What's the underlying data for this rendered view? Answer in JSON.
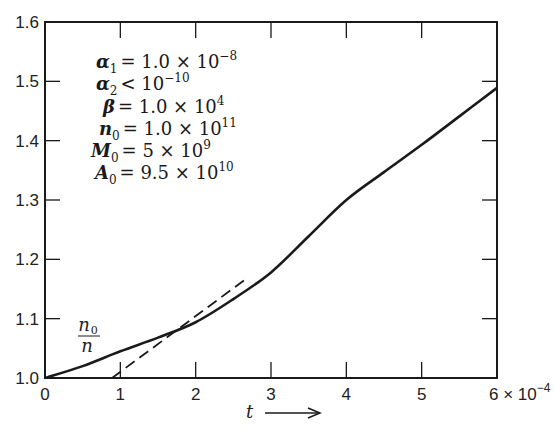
{
  "chart_data": {
    "type": "line",
    "title": "",
    "xlabel": "t",
    "xlabel_arrow": "→",
    "x_multiplier_label": "6 × 10⁻⁴",
    "x_scale_exponent": "-4",
    "ylabel": "",
    "xlim": [
      0,
      6
    ],
    "ylim": [
      1.0,
      1.6
    ],
    "grid": false,
    "x_ticks": [
      "0",
      "1",
      "2",
      "3",
      "4",
      "5",
      "6"
    ],
    "y_ticks": [
      "1.0",
      "1.1",
      "1.2",
      "1.3",
      "1.4",
      "1.5",
      "1.6"
    ],
    "series": [
      {
        "name": "n0/n",
        "style": "solid",
        "label_text": "n₀/n",
        "x": [
          0,
          0.5,
          1,
          1.5,
          2,
          2.5,
          3,
          3.5,
          4,
          4.5,
          5,
          5.5,
          6
        ],
        "values": [
          1.0,
          1.02,
          1.045,
          1.068,
          1.094,
          1.133,
          1.178,
          1.239,
          1.3,
          1.347,
          1.393,
          1.441,
          1.489
        ]
      },
      {
        "name": "asymptote",
        "style": "dashed",
        "x": [
          0.89,
          2.7
        ],
        "values": [
          1.0,
          1.17
        ]
      }
    ],
    "annotations": [
      {
        "symbol": "α",
        "sub": "1",
        "relation": "=",
        "value": "1.0 × 10",
        "exp": "−8"
      },
      {
        "symbol": "α",
        "sub": "2",
        "relation": "<",
        "value": "10",
        "exp": "−10"
      },
      {
        "symbol": "β",
        "sub": "",
        "relation": "=",
        "value": "1.0 × 10",
        "exp": "4"
      },
      {
        "symbol": "n",
        "sub": "0",
        "relation": "=",
        "value": "1.0 × 10",
        "exp": "11"
      },
      {
        "symbol": "M",
        "sub": "0",
        "relation": "=",
        "value": "5 × 10",
        "exp": "9"
      },
      {
        "symbol": "A",
        "sub": "0",
        "relation": "=",
        "value": "9.5 × 10",
        "exp": "10"
      }
    ],
    "curve_label": {
      "numerator": "n",
      "numerator_sub": "0",
      "denominator": "n"
    }
  },
  "colors": {
    "ink": "#1a1a1a",
    "background": "#ffffff"
  }
}
